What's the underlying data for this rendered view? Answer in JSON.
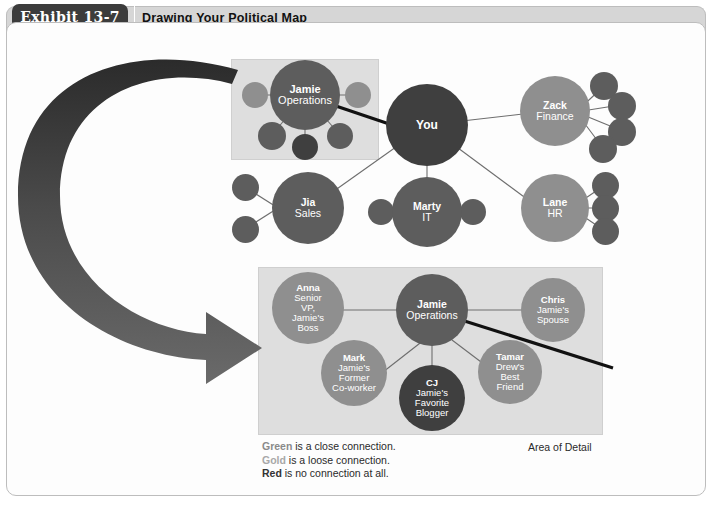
{
  "header": {
    "exhibit_label": "Exhibit 13-7",
    "title": "Drawing Your Political Map"
  },
  "legend": {
    "lines": [
      {
        "keyword": "Green",
        "rest": " is a close connection."
      },
      {
        "keyword": "Gold",
        "rest": " is a loose connection."
      },
      {
        "keyword": "Red",
        "rest": " is no connection at all."
      }
    ],
    "area_of_detail_label": "Area of Detail"
  },
  "colors": {
    "green_close": "#5d5d5d",
    "gold_loose": "#8f8f8f",
    "red_none": "#3f3f3f",
    "panel_shade": "#dedede",
    "header_bar": "#d6d6d6",
    "exhibit_tab": "#3c3c3c",
    "link_line": "#6e6e6e",
    "highlight_line": "#000000"
  },
  "overview_map": {
    "nodes": [
      {
        "id": "jamie",
        "name": "Jamie",
        "role": "Operations",
        "tone": "green"
      },
      {
        "id": "you",
        "name": "You",
        "role": "",
        "tone": "red"
      },
      {
        "id": "zack",
        "name": "Zack",
        "role": "Finance",
        "tone": "gold"
      },
      {
        "id": "jia",
        "name": "Jia",
        "role": "Sales",
        "tone": "green"
      },
      {
        "id": "marty",
        "name": "Marty",
        "role": "IT",
        "tone": "green"
      },
      {
        "id": "lane",
        "name": "Lane",
        "role": "HR",
        "tone": "gold"
      }
    ],
    "satellite_counts": {
      "jamie": 5,
      "zack": 4,
      "lane": 3,
      "jia": 2,
      "marty": 2
    }
  },
  "detail_map": {
    "nodes": [
      {
        "id": "anna",
        "name": "Anna",
        "role": "Senior VP, Jamie's Boss",
        "tone": "gold"
      },
      {
        "id": "jamie",
        "name": "Jamie",
        "role": "Operations",
        "tone": "green"
      },
      {
        "id": "chris",
        "name": "Chris",
        "role": "Jamie's Spouse",
        "tone": "gold"
      },
      {
        "id": "mark",
        "name": "Mark",
        "role": "Jamie's Former Co-worker",
        "tone": "gold"
      },
      {
        "id": "cj",
        "name": "CJ",
        "role": "Jamie's Favorite Blogger",
        "tone": "red"
      },
      {
        "id": "tamar",
        "name": "Tamar",
        "role": "Drew's Best Friend",
        "tone": "gold"
      }
    ]
  },
  "labels": {
    "anna_role_lines": [
      "Senior",
      "VP,",
      "Jamie's",
      "Boss"
    ],
    "chris_role_lines": [
      "Jamie's",
      "Spouse"
    ],
    "mark_role_lines": [
      "Jamie's",
      "Former",
      "Co-worker"
    ],
    "cj_role_lines": [
      "Jamie's",
      "Favorite",
      "Blogger"
    ],
    "tamar_role_lines": [
      "Drew's",
      "Best",
      "Friend"
    ]
  }
}
